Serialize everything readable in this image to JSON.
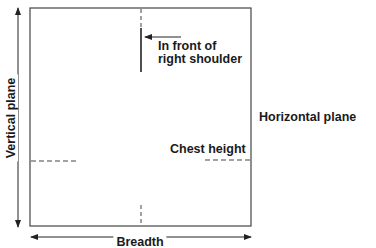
{
  "diagram": {
    "labels": {
      "shoulder_line1": "In front of",
      "shoulder_line2": "right shoulder",
      "horizontal_plane": "Horizontal plane",
      "vertical_plane": "Vertical plane",
      "chest_height": "Chest height",
      "breadth": "Breadth"
    },
    "colors": {
      "stroke": "#333333",
      "background": "#ffffff"
    }
  }
}
